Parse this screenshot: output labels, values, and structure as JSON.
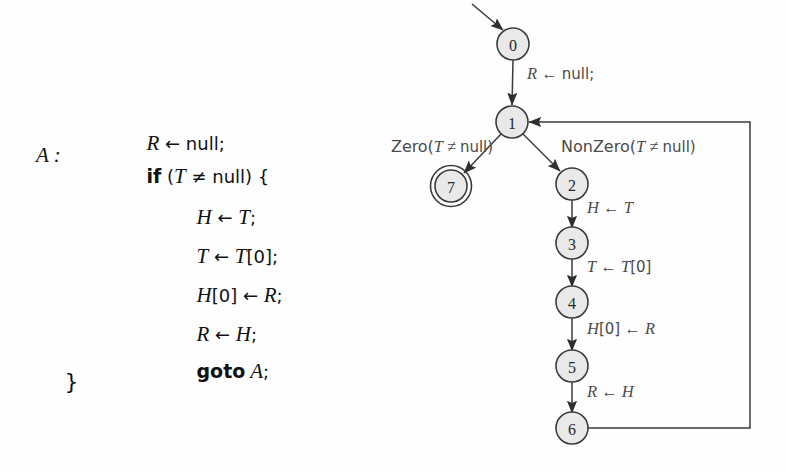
{
  "figure": {
    "kind": "control-flow-graph-with-source-listing"
  },
  "code_listing": {
    "lines": [
      {
        "id": "line-1",
        "label": "",
        "text": "R ← null;",
        "indent": 2
      },
      {
        "id": "line-2",
        "label": "A :",
        "text": "if (T ≠ null) {",
        "indent": 2
      },
      {
        "id": "line-3",
        "label": "",
        "text": "H ← T;",
        "indent": 3
      },
      {
        "id": "line-4",
        "label": "",
        "text": "T ← T[0];",
        "indent": 3
      },
      {
        "id": "line-5",
        "label": "",
        "text": "H[0] ← R;",
        "indent": 3
      },
      {
        "id": "line-6",
        "label": "",
        "text": "R ← H;",
        "indent": 3
      },
      {
        "id": "line-7",
        "label": "",
        "text": "goto A;",
        "indent": 3
      },
      {
        "id": "line-8",
        "label": "",
        "text": "}",
        "indent": 0
      }
    ],
    "block_label": "A :"
  },
  "graph": {
    "nodes": [
      {
        "id": "n0",
        "label": "0",
        "x": 513,
        "y": 44,
        "accepting": false
      },
      {
        "id": "n1",
        "label": "1",
        "x": 512,
        "y": 122,
        "accepting": false
      },
      {
        "id": "n7",
        "label": "7",
        "x": 451,
        "y": 186,
        "accepting": true
      },
      {
        "id": "n2",
        "label": "2",
        "x": 572,
        "y": 184,
        "accepting": false
      },
      {
        "id": "n3",
        "label": "3",
        "x": 572,
        "y": 243,
        "accepting": false
      },
      {
        "id": "n4",
        "label": "4",
        "x": 572,
        "y": 302,
        "accepting": false
      },
      {
        "id": "n5",
        "label": "5",
        "x": 572,
        "y": 366,
        "accepting": false
      },
      {
        "id": "n6",
        "label": "6",
        "x": 572,
        "y": 428,
        "accepting": false
      }
    ],
    "edges": [
      {
        "id": "e-entry",
        "from": "entry",
        "to": "n0",
        "label": ""
      },
      {
        "id": "e-0-1",
        "from": "n0",
        "to": "n1",
        "label": "R ← null;"
      },
      {
        "id": "e-1-7",
        "from": "n1",
        "to": "n7",
        "label": "Zero(T ≠ null)"
      },
      {
        "id": "e-1-2",
        "from": "n1",
        "to": "n2",
        "label": "NonZero(T ≠ null)"
      },
      {
        "id": "e-2-3",
        "from": "n2",
        "to": "n3",
        "label": "H ← T"
      },
      {
        "id": "e-3-4",
        "from": "n3",
        "to": "n4",
        "label": "T ← T[0]"
      },
      {
        "id": "e-4-5",
        "from": "n4",
        "to": "n5",
        "label": "H[0] ← R"
      },
      {
        "id": "e-5-6",
        "from": "n5",
        "to": "n6",
        "label": "R ← H"
      },
      {
        "id": "e-6-1",
        "from": "n6",
        "to": "n1",
        "label": ""
      }
    ],
    "edge_labels": {
      "init": "R ← null;",
      "zero": "Zero(T ≠ null)",
      "nonzero": "NonZero(T ≠ null)",
      "assign_h": "H ← T",
      "assign_t": "T ← T[0]",
      "store_h0": "H[0] ← R",
      "assign_r": "R ← H"
    }
  },
  "colors": {
    "node_fill": "#e9e9e9",
    "node_stroke": "#3b3b3b",
    "edge_stroke": "#3a3a3a",
    "edge_label": "#4a4a4a",
    "code_text": "#111111",
    "background": "#fefefe"
  }
}
